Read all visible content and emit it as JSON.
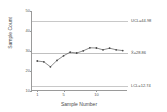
{
  "chart_data": {
    "type": "line",
    "title": "",
    "subtitle": "",
    "xlabel": "Sample Number",
    "ylabel": "Sample Count",
    "xlim": [
      0.2,
      14.8
    ],
    "ylim": [
      10,
      50
    ],
    "xticks": [
      1,
      5,
      10
    ],
    "xticklabels": [
      "1",
      "5",
      "10"
    ],
    "yticks": [
      10,
      20,
      30,
      40,
      50
    ],
    "yticklabels": [
      "10",
      "20",
      "30",
      "40",
      "50"
    ],
    "grid": false,
    "legend": "none",
    "x": [
      1,
      2,
      3,
      4,
      5,
      6,
      7,
      8,
      9,
      10,
      11,
      12,
      13,
      14
    ],
    "series": [
      {
        "name": "Sample Count",
        "values": [
          25.0,
          24.6,
          22.1,
          25.3,
          27.6,
          29.4,
          29.0,
          30.1,
          31.6,
          31.5,
          30.6,
          31.4,
          30.6,
          30.2
        ]
      }
    ],
    "reference_lines": [
      {
        "name": "UCL",
        "label": "UCL=44.98",
        "value": 44.98
      },
      {
        "name": "center",
        "label": "X̄=28.86",
        "value": 28.86
      },
      {
        "name": "LCL",
        "label": "LCL=12.74",
        "value": 12.74
      }
    ],
    "colors": {
      "series": "#5a5a5a",
      "reference_line": "#c8c8c8",
      "axis": "#9a9a9a",
      "text": "#4a4a4a",
      "background": "#ffffff"
    }
  }
}
